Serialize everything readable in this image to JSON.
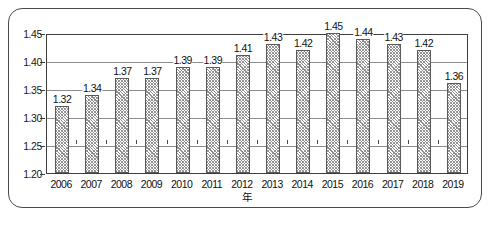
{
  "chart_data": {
    "type": "bar",
    "title": "",
    "subtitle": "",
    "xlabel": "年",
    "ylabel": "",
    "ylim": [
      1.2,
      1.45
    ],
    "ytick_step": 0.05,
    "yticks": [
      "1.45",
      "1.40",
      "1.35",
      "1.30",
      "1.25",
      "1.20"
    ],
    "grid": true,
    "legend": "none",
    "categories": [
      "2006",
      "2007",
      "2008",
      "2009",
      "2010",
      "2011",
      "2012",
      "2013",
      "2014",
      "2015",
      "2016",
      "2017",
      "2018",
      "2019"
    ],
    "values": [
      1.32,
      1.34,
      1.37,
      1.37,
      1.39,
      1.39,
      1.41,
      1.43,
      1.42,
      1.45,
      1.44,
      1.43,
      1.42,
      1.36
    ],
    "data_labels": [
      "1.32",
      "1.34",
      "1.37",
      "1.37",
      "1.39",
      "1.39",
      "1.41",
      "1.43",
      "1.42",
      "1.45",
      "1.44",
      "1.43",
      "1.42",
      "1.36"
    ],
    "series": [
      {
        "name": "",
        "values": [
          1.32,
          1.34,
          1.37,
          1.37,
          1.39,
          1.39,
          1.41,
          1.43,
          1.42,
          1.45,
          1.44,
          1.43,
          1.42,
          1.36
        ]
      }
    ],
    "colors": {
      "bar_fill": "#ffffff",
      "bar_hatch": "#8e8e8e",
      "bar_border": "#5a5a5a",
      "axis": "#3d3d3d",
      "gridline": "#8d8d8d",
      "text": "#111111",
      "frame": "#4a4a4a"
    }
  }
}
